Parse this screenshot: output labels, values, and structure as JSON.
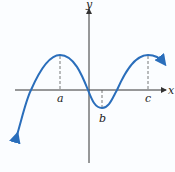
{
  "figure": {
    "type": "function-graph",
    "axes": {
      "x_label": "x",
      "y_label": "y"
    },
    "points": [
      {
        "label": "a",
        "kind": "local maximum"
      },
      {
        "label": "b",
        "kind": "local minimum"
      },
      {
        "label": "c",
        "kind": "local maximum"
      }
    ],
    "colors": {
      "curve": "#2a6ebb",
      "axis": "#333333",
      "dashed": "#555555",
      "background": "#fbfdff"
    }
  }
}
